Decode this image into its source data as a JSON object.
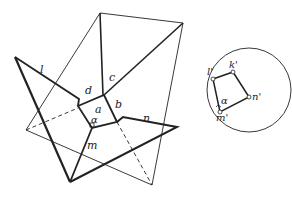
{
  "diagram": {
    "colors": {
      "line": "#222222",
      "background": "#ffffff"
    },
    "main_figure": {
      "labels": {
        "l": "l",
        "d": "d",
        "c": "c",
        "a": "a",
        "b": "b",
        "alpha": "α",
        "n": "n",
        "m": "m"
      }
    },
    "projection_circle": {
      "labels": {
        "l_prime": "l'",
        "k_prime": "k'",
        "n_prime": "n'",
        "m_prime": "m'",
        "alpha": "α"
      }
    }
  }
}
